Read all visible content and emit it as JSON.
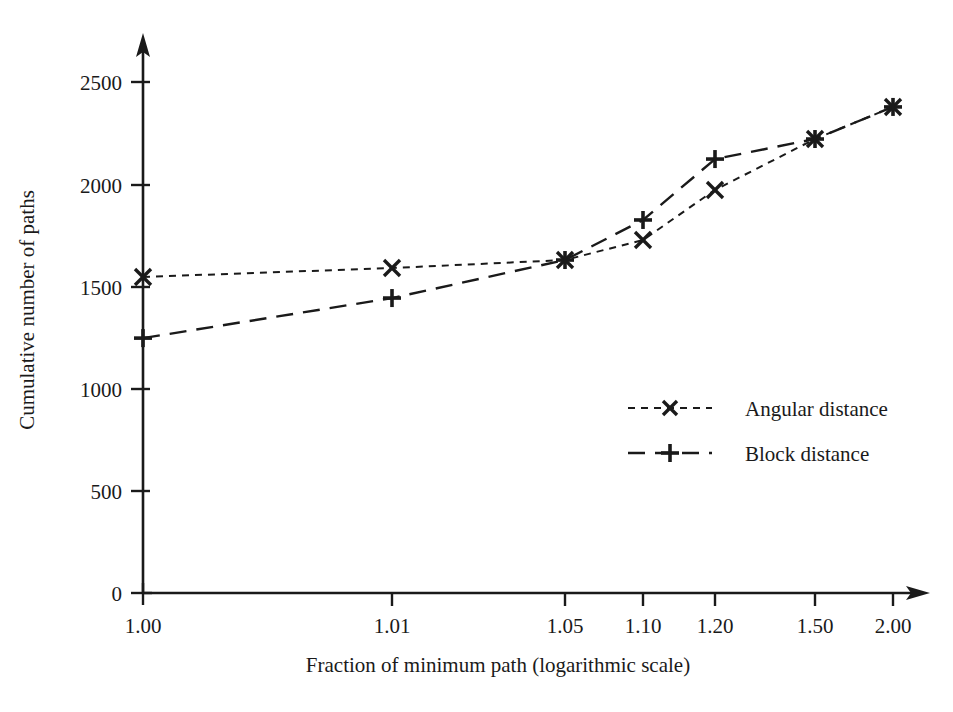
{
  "chart_data": {
    "type": "line",
    "title": "",
    "subtitle": "",
    "xlabel": "Fraction of minimum path (logarithmic scale)",
    "ylabel": "Cumulative number of paths",
    "x": [
      1.0,
      1.01,
      1.05,
      1.1,
      1.2,
      1.5,
      2.0
    ],
    "xtick_labels": [
      "1.00",
      "1.01",
      "1.05",
      "1.10",
      "1.20",
      "1.50",
      "2.00"
    ],
    "ytick_labels": [
      "0",
      "500",
      "1000",
      "1500",
      "2000",
      "2500"
    ],
    "yticks": [
      0,
      500,
      1000,
      1500,
      2000,
      2500
    ],
    "ylim": [
      0,
      2650
    ],
    "xscale": "log",
    "grid": false,
    "legend_position": "center-right",
    "series": [
      {
        "name": "Angular distance",
        "marker": "x",
        "linestyle": "dotted",
        "values": [
          1546,
          1590,
          1629,
          1727,
          1972,
          2221,
          2378
        ]
      },
      {
        "name": "Block distance",
        "marker": "+",
        "linestyle": "dashed",
        "values": [
          1247,
          1443,
          1629,
          1825,
          2123,
          2221,
          2378
        ]
      }
    ]
  },
  "axes": {
    "x_axis_name": "x-axis",
    "y_axis_name": "y-axis"
  },
  "legend": {
    "items": [
      {
        "label": "Angular distance",
        "marker": "x-marker",
        "line": "dotted-line"
      },
      {
        "label": "Block distance",
        "marker": "plus-marker",
        "line": "dashed-line"
      }
    ]
  },
  "colors": {
    "ink": "#1a1a1a",
    "background": "#ffffff"
  }
}
